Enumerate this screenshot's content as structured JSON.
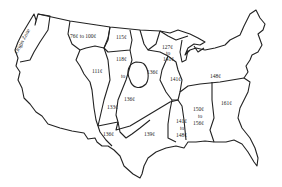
{
  "map": {
    "title": "",
    "colors": {
      "outline": "#222222",
      "background": "#ffffff",
      "text": "#222222"
    },
    "zones": [
      {
        "id": "origin",
        "label": "Origin Zone"
      },
      {
        "id": "northwest",
        "label": "76¢ to 100¢"
      },
      {
        "id": "north-plains",
        "label": "115¢"
      },
      {
        "id": "mountain",
        "label": "111¢"
      },
      {
        "id": "plains",
        "label_top": "118¢",
        "label_mid": "to",
        "label_bottom": "133¢"
      },
      {
        "id": "central",
        "label": "136¢"
      },
      {
        "id": "upper-midwest",
        "label_top": "127¢",
        "label_mid": "to",
        "label_bottom": "141¢"
      },
      {
        "id": "iowa-island",
        "label": "136¢"
      },
      {
        "id": "illinois",
        "label": "141¢"
      },
      {
        "id": "northeast",
        "label": "148¢"
      },
      {
        "id": "southwest",
        "label": "136¢"
      },
      {
        "id": "texas",
        "label": "139¢"
      },
      {
        "id": "mississippi",
        "label_top": "141¢",
        "label_mid": "to",
        "label_bottom": "148¢"
      },
      {
        "id": "alabama-georgia",
        "label_top": "150¢",
        "label_mid": "to",
        "label_bottom": "156¢"
      },
      {
        "id": "southeast",
        "label": "161¢"
      }
    ]
  }
}
